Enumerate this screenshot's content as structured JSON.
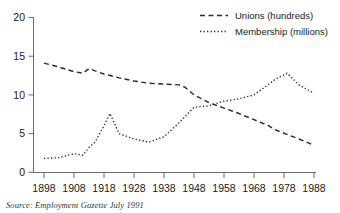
{
  "chart_data": {
    "type": "line",
    "title": "",
    "xlabel": "",
    "ylabel": "",
    "xlim": [
      1898,
      1988
    ],
    "ylim": [
      0,
      20
    ],
    "grid": false,
    "legend_position": "top-right",
    "xticks": [
      "1898",
      "1908",
      "1918",
      "1928",
      "1938",
      "1948",
      "1958",
      "1968",
      "1978",
      "1988"
    ],
    "yticks": [
      "0",
      "5",
      "10",
      "15",
      "20"
    ],
    "x": [
      1898,
      1903,
      1908,
      1911,
      1913,
      1915,
      1918,
      1920,
      1923,
      1928,
      1933,
      1938,
      1943,
      1945,
      1948,
      1953,
      1958,
      1963,
      1968,
      1973,
      1975,
      1979,
      1983,
      1988
    ],
    "series": [
      {
        "name": "Unions (hundreds)",
        "style": "dashed",
        "values": [
          14.1,
          13.6,
          13.0,
          12.8,
          13.4,
          13.1,
          12.7,
          12.5,
          12.2,
          11.8,
          11.5,
          11.4,
          11.3,
          11.0,
          10.0,
          9.0,
          8.3,
          7.6,
          6.8,
          6.0,
          5.5,
          4.9,
          4.3,
          3.5
        ]
      },
      {
        "name": "Membership (millions)",
        "style": "dotted",
        "values": [
          1.8,
          1.9,
          2.4,
          2.2,
          3.2,
          3.9,
          6.0,
          7.6,
          5.0,
          4.3,
          3.9,
          4.6,
          6.4,
          7.2,
          8.4,
          8.6,
          9.2,
          9.5,
          10.0,
          11.4,
          12.0,
          12.8,
          11.3,
          10.2
        ]
      }
    ],
    "legend": [
      {
        "label": "Unions (hundreds)",
        "style": "dashed"
      },
      {
        "label": "Membership (millions)",
        "style": "dotted"
      }
    ]
  },
  "source": {
    "note": "Source: Employment Gazette July 1991"
  },
  "colors": {
    "line": "#2b2b2b",
    "axis": "#6b6b6b",
    "text": "#1a1a1a",
    "background": "#ffffff"
  }
}
